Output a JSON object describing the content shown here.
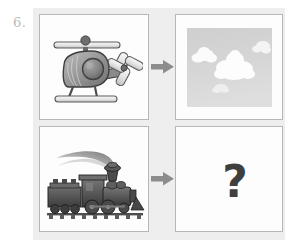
{
  "worksheet": {
    "question_number": "6.",
    "background_color": "#eeeeee",
    "page_background": "#ffffff"
  },
  "arrows": {
    "icon": "arrow-right-icon",
    "color": "#8c8c8c",
    "count": 2,
    "top_label": "",
    "bottom_label": ""
  },
  "cells": [
    {
      "id": "top-left",
      "role": "prompt",
      "content_type": "illustration",
      "subject": "helicopter",
      "alt_text": "Grayscale cartoon helicopter with main rotor, tail rotor and landing skids",
      "colors": {
        "body": "#8f8f8f",
        "outline": "#4a4a4a",
        "rotor": "#e6e6e6",
        "window": "#7a7a7a"
      }
    },
    {
      "id": "top-right",
      "role": "answer",
      "content_type": "photo",
      "subject": "clouds in the sky",
      "alt_text": "Photograph of white clouds against a pale gray sky",
      "colors": {
        "sky": "#d2d2d2",
        "clouds": "#fbfbfb"
      }
    },
    {
      "id": "bottom-left",
      "role": "prompt",
      "content_type": "illustration",
      "subject": "steam locomotive",
      "alt_text": "Grayscale steam locomotive train with a plume of smoke rising from the stack",
      "colors": {
        "body": "#595959",
        "outline": "#2e2e2e",
        "smoke": "#a9a9a9"
      }
    },
    {
      "id": "bottom-right",
      "role": "answer-blank",
      "content_type": "text",
      "subject": "question-mark",
      "text": "?",
      "alt_text": "Large bold question mark indicating the missing answer",
      "colors": {
        "text": "#3f3f3f"
      }
    }
  ]
}
